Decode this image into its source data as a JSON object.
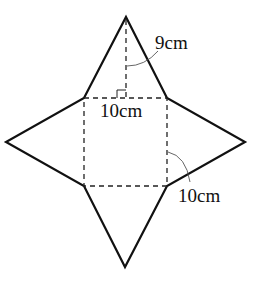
{
  "diagram": {
    "labels": {
      "height": "9cm",
      "base_side": "10cm",
      "lateral_edge": "10cm"
    },
    "square": {
      "x1": 84,
      "y1": 98,
      "x2": 167,
      "y2": 186
    },
    "apexes": {
      "top": [
        126,
        17
      ],
      "right": [
        245,
        142
      ],
      "bottom": [
        125,
        267
      ],
      "left": [
        6,
        142
      ]
    },
    "colors": {
      "line": "#111111",
      "background": "#ffffff"
    }
  }
}
